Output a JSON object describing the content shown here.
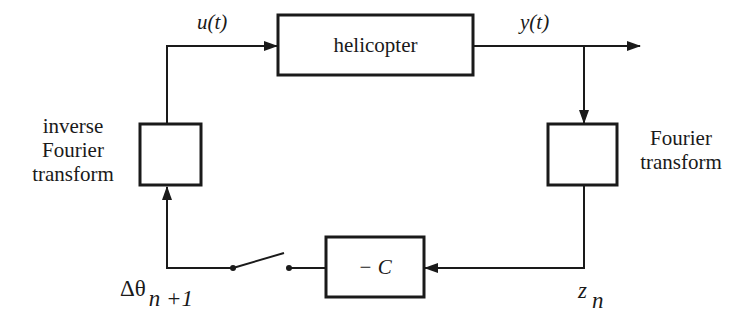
{
  "diagram": {
    "type": "block-diagram",
    "blocks": {
      "plant": {
        "label": "helicopter"
      },
      "fourier": {
        "label": "",
        "caption_line1": "Fourier",
        "caption_line2": "transform"
      },
      "inverse_fourier": {
        "label": "",
        "caption_line1": "inverse",
        "caption_line2": "Fourier",
        "caption_line3": "transform"
      },
      "gain": {
        "label": "− C"
      }
    },
    "signals": {
      "input": "u(t)",
      "output": "y(t)",
      "measurement_base": "z",
      "measurement_sub": "n",
      "update_base": "Δθ",
      "update_sub": "n +1"
    },
    "elements": {
      "switch": "open switch"
    },
    "colors": {
      "stroke": "#1a1a1a",
      "background": "#ffffff"
    }
  }
}
